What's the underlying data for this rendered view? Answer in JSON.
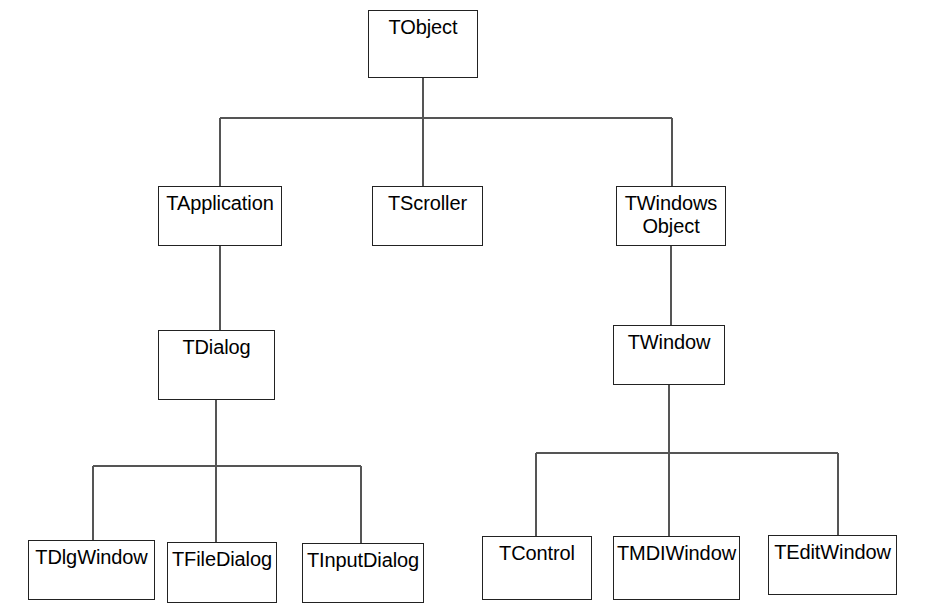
{
  "diagram": {
    "type": "class-hierarchy-tree",
    "background_color": "#ffffff",
    "box_border_color": "#222222",
    "connector_color": "#555555",
    "text_color": "#000000",
    "nodes": [
      {
        "id": "tobject",
        "label": "TObject",
        "x": 368,
        "y": 10,
        "w": 110,
        "h": 68
      },
      {
        "id": "tapplication",
        "label": "TApplication",
        "x": 158,
        "y": 186,
        "w": 124,
        "h": 60
      },
      {
        "id": "tscroller",
        "label": "TScroller",
        "x": 372,
        "y": 186,
        "w": 111,
        "h": 60
      },
      {
        "id": "twindowsobject",
        "label": "TWindows\nObject",
        "x": 616,
        "y": 186,
        "w": 110,
        "h": 60
      },
      {
        "id": "tdialog",
        "label": "TDialog",
        "x": 158,
        "y": 330,
        "w": 117,
        "h": 70
      },
      {
        "id": "twindow",
        "label": "TWindow",
        "x": 613,
        "y": 325,
        "w": 112,
        "h": 60
      },
      {
        "id": "tdlgwindow",
        "label": "TDlgWindow",
        "x": 28,
        "y": 540,
        "w": 127,
        "h": 60
      },
      {
        "id": "tfiledialog",
        "label": "TFileDialog",
        "x": 167,
        "y": 542,
        "w": 110,
        "h": 61
      },
      {
        "id": "tinputdialog",
        "label": "TInputDialog",
        "x": 302,
        "y": 543,
        "w": 122,
        "h": 60
      },
      {
        "id": "tcontrol",
        "label": "TControl",
        "x": 482,
        "y": 536,
        "w": 110,
        "h": 64
      },
      {
        "id": "tmdiwindow",
        "label": "TMDIWindow",
        "x": 613,
        "y": 536,
        "w": 127,
        "h": 64
      },
      {
        "id": "teditwindow",
        "label": "TEditWindow",
        "x": 768,
        "y": 535,
        "w": 129,
        "h": 60
      }
    ],
    "edges": [
      {
        "from": "tobject",
        "to": "tapplication"
      },
      {
        "from": "tobject",
        "to": "tscroller"
      },
      {
        "from": "tobject",
        "to": "twindowsobject"
      },
      {
        "from": "tapplication",
        "to": "tdialog"
      },
      {
        "from": "twindowsobject",
        "to": "twindow"
      },
      {
        "from": "tdialog",
        "to": "tdlgwindow"
      },
      {
        "from": "tdialog",
        "to": "tfiledialog"
      },
      {
        "from": "tdialog",
        "to": "tinputdialog"
      },
      {
        "from": "twindow",
        "to": "tcontrol"
      },
      {
        "from": "twindow",
        "to": "tmdiwindow"
      },
      {
        "from": "twindow",
        "to": "teditwindow"
      }
    ],
    "connector_paths": [
      "M 423 78 L 423 118",
      "M 220 118 L 672 118",
      "M 220 118 L 220 186",
      "M 423 118 L 423 186",
      "M 672 118 L 672 186",
      "M 220 246 L 220 330",
      "M 671 246 L 671 325",
      "M 216 400 L 216 466",
      "M 93 466 L 361 466",
      "M 93 466 L 93 540",
      "M 216 466 L 216 542",
      "M 361 466 L 361 543",
      "M 669 385 L 669 453",
      "M 536 453 L 838 453",
      "M 536 453 L 536 536",
      "M 669 453 L 669 536",
      "M 838 453 L 838 535"
    ]
  }
}
